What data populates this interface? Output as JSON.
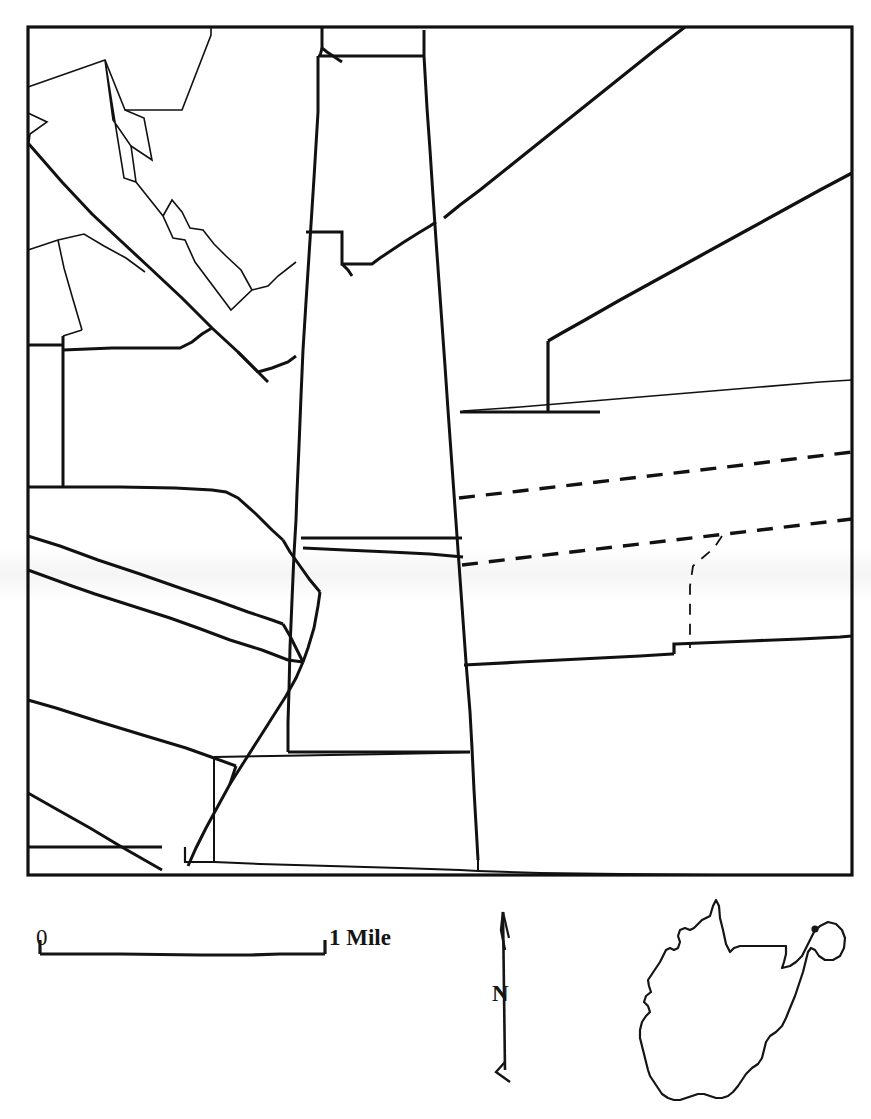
{
  "document": {
    "type": "cadastral-parcel-map",
    "page_background": "#ffffff",
    "ink_color": "#111111",
    "caption": ""
  },
  "map_frame": {
    "name": "parcel-map-frame",
    "x": 28,
    "y": 27,
    "width": 824,
    "height": 848,
    "stroke_width": 3.2
  },
  "legend": {
    "scale_bar": {
      "name": "scale-bar",
      "zero_label": "0",
      "max_label": "1 Mile",
      "left_x": 40,
      "right_x": 325,
      "baseline_y": 953,
      "tick_height": 13,
      "unit": "Mile",
      "span_value": 1
    },
    "north_arrow": {
      "name": "north-arrow",
      "label": "N",
      "tip_x": 503,
      "tip_y": 910,
      "tail_x": 503,
      "tail_y": 1075
    },
    "locator_inset": {
      "name": "west-virginia-locator-inset",
      "state": "West Virginia",
      "marker": "study-area-dot",
      "marker_x": 815,
      "marker_y": 929
    }
  },
  "colors": {
    "ink": "#111111",
    "paper": "#ffffff",
    "artifact_band": "rgba(0,0,0,0.04)"
  }
}
